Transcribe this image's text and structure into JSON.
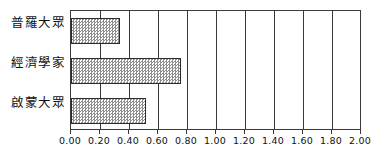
{
  "chart_data": {
    "type": "bar",
    "orientation": "horizontal",
    "title": "",
    "xlabel": "",
    "ylabel": "",
    "categories": [
      "普羅大眾",
      "經濟學家",
      "啟蒙大眾"
    ],
    "values": [
      0.34,
      0.76,
      0.52
    ],
    "xlim": [
      0.0,
      2.0
    ],
    "xticks": [
      0.0,
      0.2,
      0.4,
      0.6,
      0.8,
      1.0,
      1.2,
      1.4,
      1.6,
      1.8,
      2.0
    ],
    "xtick_labels": [
      "0.00",
      "0.20",
      "0.40",
      "0.60",
      "0.80",
      "1.00",
      "1.20",
      "1.40",
      "1.60",
      "1.80",
      "2.00"
    ],
    "grid": true,
    "grid_axis": "x",
    "legend": false,
    "bar_fill": "#8e8e8e",
    "bar_pattern": "checker-dither",
    "bar_edge_color": "#2c2c2c",
    "frame_color": "#3a3a3a",
    "background": "#ffffff"
  }
}
